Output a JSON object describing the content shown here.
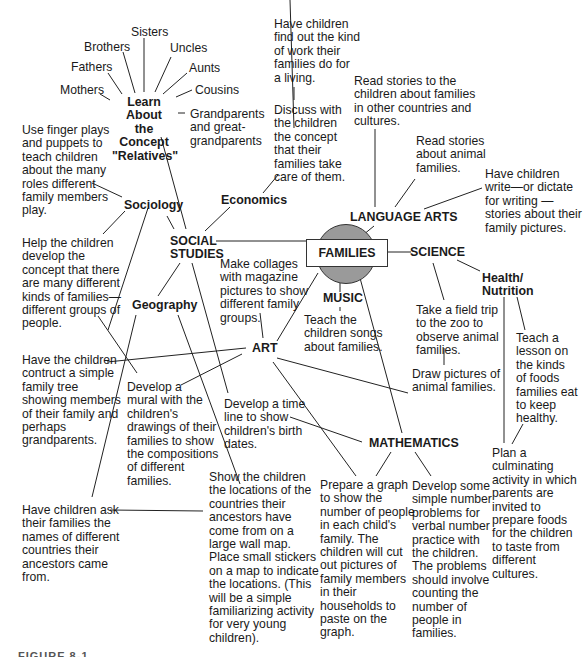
{
  "center": {
    "label": "FAMILIES"
  },
  "hubs": {
    "social_studies": "SOCIAL\nSTUDIES",
    "language_arts": "LANGUAGE ARTS",
    "science": "SCIENCE",
    "health_nutrition": "Health/\nNutrition",
    "music": "MUSIC",
    "art": "ART",
    "mathematics": "MATHEMATICS",
    "sociology": "Sociology",
    "economics": "Economics",
    "geography": "Geography",
    "relatives": "Learn About\nthe Concept\n\"Relatives\""
  },
  "relatives": {
    "sisters": "Sisters",
    "brothers": "Brothers",
    "uncles": "Uncles",
    "fathers": "Fathers",
    "aunts": "Aunts",
    "mothers": "Mothers",
    "cousins": "Cousins",
    "grandparents": "Grandparents\nand great-\ngrandparents"
  },
  "activities": {
    "economics_work": "Have children\nfind out the kind\nof work their\nfamilies do for\na living.",
    "economics_care": "Discuss with\nthe children\nthe concept\nthat their\nfamilies take\ncare of them.",
    "lang_other_countries": "Read stories to the\nchildren about families\nin other countries and\ncultures.",
    "lang_animal_stories": "Read stories\nabout animal\nfamilies.",
    "lang_write": "Have children\nwrite—or dictate\nfor writing —\nstories about their\nfamily pictures.",
    "sociology_fingerplays": "Use finger plays\nand puppets to\nteach children\nabout the many\nroles different\nfamily members\nplay.",
    "sociology_kinds": "Help the children\ndevelop the\nconcept that there\nare many different\nkinds of families—\ndifferent groups of\npeople.",
    "art_collages": "Make collages\nwith magazine\npictures to show\ndifferent family\ngroups.",
    "music_songs": "Teach the\nchildren songs\nabout families.",
    "science_zoo": "Take a field trip\nto the zoo to\nobserve animal\nfamilies.",
    "science_draw": "Draw pictures of\nanimal families.",
    "health_lesson": "Teach a\nlesson on\nthe kinds\nof foods\nfamilies eat\nto keep\nhealthy.",
    "health_culminating": "Plan a\nculminating\nactivity in which\nparents are\ninvited to\nprepare foods\nfor the children\nto taste from\ndifferent\ncultures.",
    "family_tree": "Have the children\ncontruct a simple\nfamily tree\nshowing members\nof their family and\nperhaps\ngrandparents.",
    "art_mural": "Develop  a\nmural with the\nchildren's\ndrawings of their\nfamilies to show\nthe compositions\nof different\nfamilies.",
    "time_line": "Develop a time\nline to show\nchildren's birth\ndates.",
    "geo_ask": "Have children ask\ntheir families the\nnames of different\ncountries their\nancestors came\nfrom.",
    "geo_map": "Show the children\nthe locations of the\ncountries their\nancestors have\ncome from on a\nlarge wall map.\nPlace small stickers\non a map to indicate\nthe locations. (This\nwill be a simple\nfamiliarizing activity\nfor very young\nchildren).",
    "math_graph": "Prepare a graph\nto show the\nnumber of people\nin each child's\nfamily.  The\nchildren will cut\nout pictures of\nfamily members\nin their\nhouseholds to\npaste on the\ngraph.",
    "math_problems": "Develop some\nsimple number\nproblems for\nverbal number\npractice with\nthe children.\nThe problems\nshould involve\ncounting the\nnumber of\npeople in\nfamilies."
  },
  "caption": {
    "label": "FIGURE 8-1"
  },
  "colors": {
    "circle_fill": "#9a9a9a",
    "line": "#222222",
    "background": "#ffffff"
  }
}
